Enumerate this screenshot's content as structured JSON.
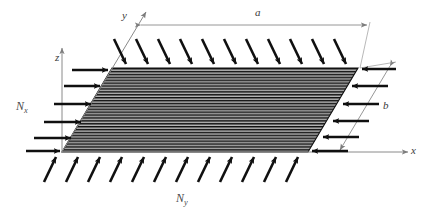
{
  "figure": {
    "type": "engineering-diagram",
    "background_color": "#ffffff",
    "ink_color": "#1a1a1a",
    "thin_line_color": "#8a8a8a",
    "plate_fill_color": "#b0b0b0",
    "hatch_color": "#101010"
  },
  "axes": {
    "x": {
      "label": "x"
    },
    "y": {
      "label": "y"
    },
    "z": {
      "label": "z"
    }
  },
  "dimensions": {
    "length": {
      "label": "a"
    },
    "width": {
      "label": "b"
    }
  },
  "loads": {
    "nx": {
      "symbol": "N",
      "subscript": "x",
      "label": "Nx"
    },
    "ny": {
      "symbol": "N",
      "subscript": "y",
      "label": "Ny"
    }
  },
  "plate": {
    "corners": {
      "top_left": [
        112,
        68
      ],
      "top_right": [
        358,
        68
      ],
      "bottom_right": [
        308,
        152
      ],
      "bottom_left": [
        62,
        152
      ]
    },
    "hatch_line_count": 29
  },
  "arrow_groups": {
    "top_edge": {
      "count": 11,
      "direction": "down-right",
      "points_to": "plate-top-edge"
    },
    "bottom_edge": {
      "count": 11,
      "direction": "up-right",
      "points_to": "plate-bottom-edge"
    },
    "left_edge": {
      "count": 6,
      "direction": "right",
      "points_to": "plate-left-edge"
    },
    "right_edge": {
      "count": 6,
      "direction": "left",
      "points_to": "plate-right-edge"
    }
  }
}
